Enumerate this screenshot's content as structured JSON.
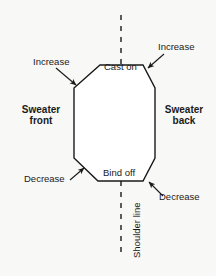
{
  "diagram": {
    "background_color": "#f8f8f6",
    "line_color": "#1a1a1a",
    "shape": {
      "name": "octagon-body",
      "description": "Octagonal knitting piece outline",
      "fill": "#ffffff"
    },
    "labels": {
      "cast_on": "Cast on",
      "bind_off": "Bind off",
      "increase_left": "Increase",
      "increase_right": "Increase",
      "decrease_left": "Decrease",
      "decrease_right": "Decrease",
      "sweater_front_line1": "Sweater",
      "sweater_front_line2": "front",
      "sweater_back_line1": "Sweater",
      "sweater_back_line2": "back",
      "shoulder_line": "Shoulder line"
    },
    "dashed_lines": {
      "top": "shoulder-line-top-dashed",
      "bottom": "shoulder-line-bottom-dashed"
    }
  }
}
